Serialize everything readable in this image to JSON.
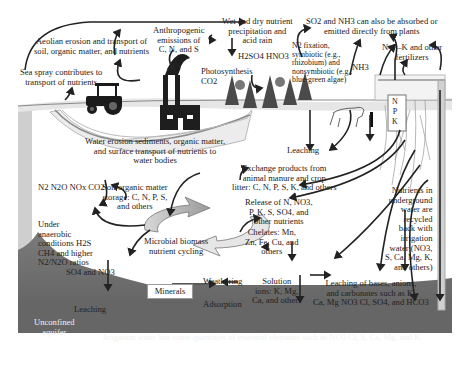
{
  "diagram": {
    "labels": {
      "aeolian": [
        "Aeolian erosion and transport of",
        "soil, organic matter, and nutrients"
      ],
      "sea_spray": [
        "Sea spray contributes to",
        "transport of nutrients"
      ],
      "anthropogenic": [
        "Anthropogenic",
        "emissions of",
        "C, N, and S"
      ],
      "wet_dry": [
        "Wet and dry nutrient",
        "precipitation and",
        "acid rain"
      ],
      "acids": "H2SO4 HNO3",
      "photosynthesis": [
        "Photosynthesis",
        "CO2"
      ],
      "so2_nh3": [
        "SO2 and NH3 can also be absorbed or",
        "emitted directly from plants"
      ],
      "n2_fixation": [
        "N2 fixation,",
        "symbiotic (e.g.,",
        "rhizobium) and",
        "nonsymbiotic (e.g.,",
        "blue-green algae)"
      ],
      "nh3": "NH3",
      "npk_fertilizers": [
        "N–P–K and other",
        "fertilizers"
      ],
      "npk_bag": [
        "N",
        "P",
        "K"
      ],
      "water_erosion": [
        "Water erosion sediments, organic matter,",
        "and surface transport of nutrients to",
        "water bodies"
      ],
      "leaching_top": "Leaching",
      "gases": "N2 N2O NOx CO2",
      "soil_om": [
        "Soil organic matter",
        "storage: C, N, P, S,",
        "and others"
      ],
      "exchange": [
        "Exchange products from",
        "animal manure and crop",
        "litter: C, N, P, S, K, and others"
      ],
      "release": [
        "Release of N, NO3,",
        "P, K, S, SO4, and",
        "other nutrients"
      ],
      "chelates": [
        "Chelates: Mn,",
        "Zn, Fe, Cu, and",
        "others"
      ],
      "anaerobic": [
        "Under",
        "anaerobic",
        "conditions H2S",
        "CH4 and higher",
        "N2/N2O ratios"
      ],
      "microbial": [
        "Microbial biomass",
        "nutrient cycling"
      ],
      "so4_no3": "SO4 and NO3",
      "leaching_left": "Leaching",
      "minerals": "Minerals",
      "weathering": "Weathering",
      "adsorption": "Adsorption",
      "solution": [
        "Solution",
        "ions: K, Mg,",
        "Ca, and others"
      ],
      "groundwater": [
        "Nutrients in",
        "underground",
        "water are",
        "recycled",
        "back with",
        "irrigation",
        "water (NO3,",
        "S, Ca, Mg, K,",
        "and others)"
      ],
      "leaching_bases": [
        "Leaching of bases, anions,",
        "and carbonates such as K,",
        "Ca, Mg NO3 Cl, SO4, and HCO3"
      ],
      "aquifer": [
        "Unconfined",
        "aquifer"
      ],
      "irrigation": "Irrigation water has some quantities of essential elements such as NO3 Cl, S, Ca, Mg, and K"
    },
    "colors": {
      "arrow": "#222222",
      "aquifer": "#6b6b6b",
      "soil_line": "#9a9a9a",
      "factory": "#1e1e1e",
      "tree": "#555555"
    }
  }
}
